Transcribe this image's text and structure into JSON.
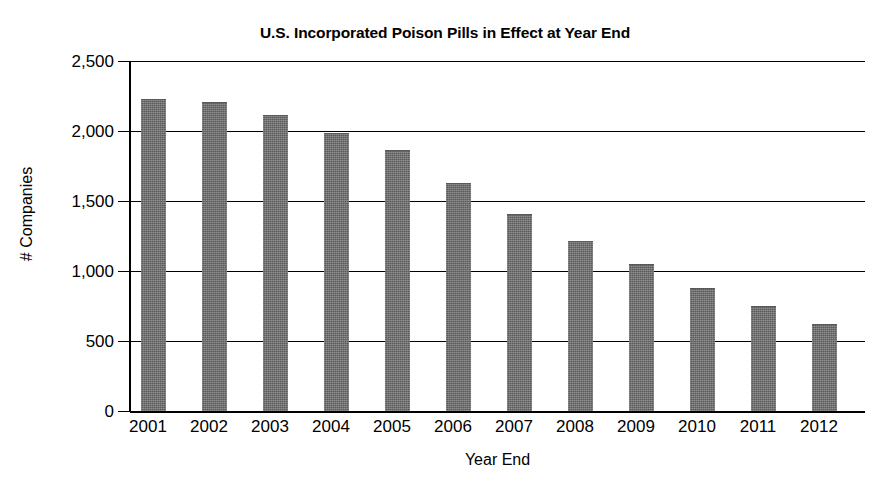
{
  "chart_data": {
    "type": "bar",
    "title": "U.S. Incorporated Poison Pills in Effect at Year End",
    "xlabel": "Year End",
    "ylabel": "# Companies",
    "categories": [
      "2001",
      "2002",
      "2003",
      "2004",
      "2005",
      "2006",
      "2007",
      "2008",
      "2009",
      "2010",
      "2011",
      "2012"
    ],
    "values": [
      2220,
      2200,
      2110,
      1980,
      1860,
      1620,
      1400,
      1210,
      1040,
      875,
      740,
      615
    ],
    "ylim": [
      0,
      2500
    ],
    "yticks": [
      0,
      500,
      1000,
      1500,
      2000,
      2500
    ],
    "ytick_labels": [
      "0",
      "500",
      "1,000",
      "1,500",
      "2,000",
      "2,500"
    ],
    "grid": true,
    "legend": false,
    "bar_color": "#6e6e6e",
    "axis_color": "#000000",
    "background_color": "#ffffff"
  }
}
